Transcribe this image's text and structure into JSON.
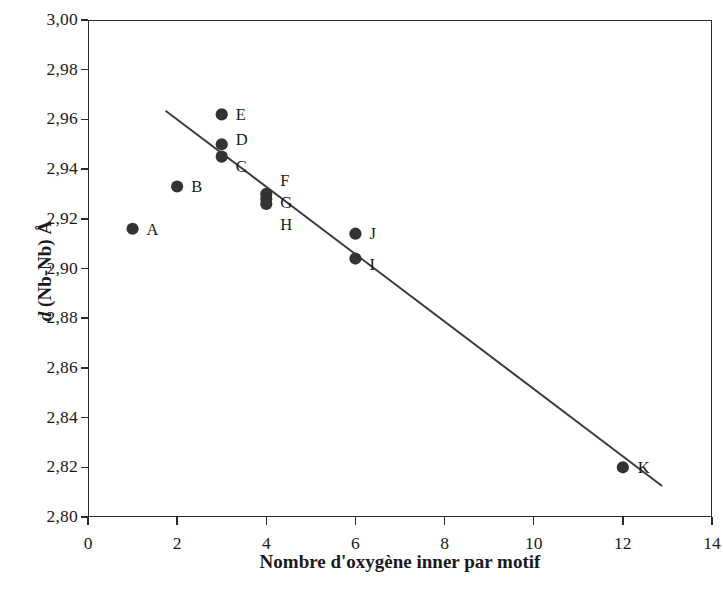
{
  "chart_data": {
    "type": "scatter",
    "title": "",
    "xlabel": "Nombre d'oxygène inner par motif",
    "ylabel": "d (Nb-Nb) Å",
    "ylabel_parts": {
      "italic": "d",
      "bold": " (Nb-Nb) Å"
    },
    "xlim": [
      0,
      14
    ],
    "ylim": [
      2.8,
      3.0
    ],
    "xticks": [
      0,
      2,
      4,
      6,
      8,
      10,
      12,
      14
    ],
    "yticks": [
      2.8,
      2.82,
      2.84,
      2.86,
      2.88,
      2.9,
      2.92,
      2.94,
      2.96,
      2.98,
      3.0
    ],
    "xtick_labels": [
      "0",
      "2",
      "4",
      "6",
      "8",
      "10",
      "12",
      "14"
    ],
    "ytick_labels": [
      "2,80",
      "2,82",
      "2,84",
      "2,86",
      "2,88",
      "2,90",
      "2,92",
      "2,94",
      "2,96",
      "2,98",
      "3,00"
    ],
    "grid": false,
    "legend": null,
    "decimal_separator": ",",
    "marker_color": "#333333",
    "line_color": "#3a3a3a",
    "axis_color": "#2b2b2b",
    "points": [
      {
        "label": "A",
        "x": 1,
        "y": 2.916,
        "label_dx": 14,
        "label_dy": -7
      },
      {
        "label": "B",
        "x": 2,
        "y": 2.933,
        "label_dx": 14,
        "label_dy": -7
      },
      {
        "label": "C",
        "x": 3,
        "y": 2.945,
        "label_dx": 14,
        "label_dy": 2
      },
      {
        "label": "D",
        "x": 3,
        "y": 2.95,
        "label_dx": 14,
        "label_dy": -12
      },
      {
        "label": "E",
        "x": 3,
        "y": 2.962,
        "label_dx": 14,
        "label_dy": -7
      },
      {
        "label": "F",
        "x": 4,
        "y": 2.93,
        "label_dx": 14,
        "label_dy": -21
      },
      {
        "label": "G",
        "x": 4,
        "y": 2.928,
        "label_dx": 14,
        "label_dy": -4
      },
      {
        "label": "H",
        "x": 4,
        "y": 2.926,
        "label_dx": 14,
        "label_dy": 13
      },
      {
        "label": "I",
        "x": 6,
        "y": 2.904,
        "label_dx": 14,
        "label_dy": -2
      },
      {
        "label": "J",
        "x": 6,
        "y": 2.914,
        "label_dx": 14,
        "label_dy": -8
      },
      {
        "label": "K",
        "x": 12,
        "y": 2.82,
        "label_dx": 15,
        "label_dy": -7
      }
    ],
    "trend_line": {
      "x1": 1.74,
      "y1": 2.9635,
      "x2": 12.88,
      "y2": 2.8125
    }
  }
}
